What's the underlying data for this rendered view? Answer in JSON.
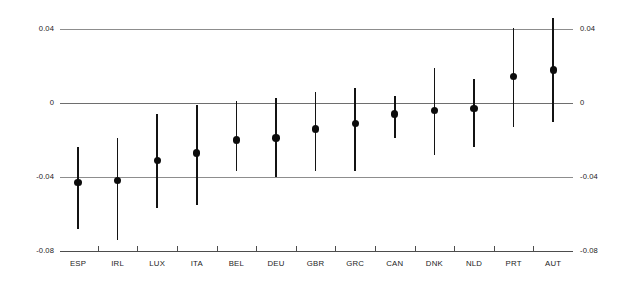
{
  "chart_data": {
    "type": "scatter",
    "title": "",
    "subtitle": "",
    "xlabel": "",
    "ylabel": "",
    "ylim": [
      -0.08,
      0.04
    ],
    "yticks": [
      0.04,
      0,
      -0.04,
      -0.08
    ],
    "ytick_labels": [
      "0.04",
      "0",
      "-0.04",
      "-0.08"
    ],
    "ytick_labels_right": [
      "0.04",
      "0",
      "-0.04",
      "-0.08"
    ],
    "grid": true,
    "gridlines_at": [
      0.04,
      0,
      -0.04,
      -0.08
    ],
    "legend": "none",
    "marker": "filled-circle",
    "errorbar_style": "vertical-line-no-caps",
    "categories": [
      "ESP",
      "IRL",
      "LUX",
      "ITA",
      "BEL",
      "DEU",
      "GBR",
      "GRC",
      "CAN",
      "DNK",
      "NLD",
      "PRT",
      "AUT"
    ],
    "values": [
      -0.043,
      -0.042,
      -0.031,
      -0.027,
      -0.02,
      -0.019,
      -0.014,
      -0.011,
      -0.006,
      -0.004,
      -0.003,
      0.0145,
      0.018
    ],
    "ci_low": [
      -0.068,
      -0.074,
      -0.057,
      -0.055,
      -0.037,
      -0.04,
      -0.037,
      -0.037,
      -0.019,
      -0.028,
      -0.024,
      -0.0127,
      -0.0105
    ],
    "ci_high": [
      -0.024,
      -0.019,
      -0.006,
      -0.001,
      0.001,
      0.003,
      0.006,
      0.008,
      0.004,
      0.019,
      0.013,
      0.0405,
      0.046
    ],
    "points": [
      {
        "label": "ESP",
        "value": -0.043,
        "ci_low": -0.068,
        "ci_high": -0.024
      },
      {
        "label": "IRL",
        "value": -0.042,
        "ci_low": -0.074,
        "ci_high": -0.019
      },
      {
        "label": "LUX",
        "value": -0.031,
        "ci_low": -0.057,
        "ci_high": -0.006
      },
      {
        "label": "ITA",
        "value": -0.027,
        "ci_low": -0.055,
        "ci_high": -0.001
      },
      {
        "label": "BEL",
        "value": -0.02,
        "ci_low": -0.037,
        "ci_high": 0.001
      },
      {
        "label": "DEU",
        "value": -0.019,
        "ci_low": -0.04,
        "ci_high": 0.003
      },
      {
        "label": "GBR",
        "value": -0.014,
        "ci_low": -0.037,
        "ci_high": 0.006
      },
      {
        "label": "GRC",
        "value": -0.011,
        "ci_low": -0.037,
        "ci_high": 0.008
      },
      {
        "label": "CAN",
        "value": -0.006,
        "ci_low": -0.019,
        "ci_high": 0.004
      },
      {
        "label": "DNK",
        "value": -0.004,
        "ci_low": -0.028,
        "ci_high": 0.019
      },
      {
        "label": "NLD",
        "value": -0.003,
        "ci_low": -0.024,
        "ci_high": 0.013
      },
      {
        "label": "PRT",
        "value": 0.0145,
        "ci_low": -0.0127,
        "ci_high": 0.0405
      },
      {
        "label": "AUT",
        "value": 0.018,
        "ci_low": -0.0105,
        "ci_high": 0.046
      }
    ],
    "colors": {
      "marker": "#0c0c0c",
      "errorbar": "#131313",
      "gridline": "#8d8d8d",
      "axis": "#4d4d4d",
      "text": "#1b1b1b",
      "background": "#ffffff"
    }
  },
  "layout": {
    "plot_left": 60,
    "plot_right": 573,
    "y_top_px": 29.3,
    "y_zero_px": 102.7,
    "y_bottom_px": 250.7,
    "x_first": 78,
    "x_step": 39.6
  }
}
